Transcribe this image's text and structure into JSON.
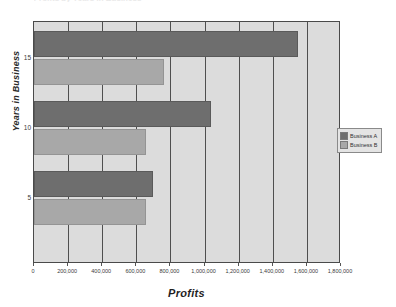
{
  "chart_data": {
    "type": "bar",
    "orientation": "horizontal",
    "title": "",
    "xlabel": "Profits",
    "ylabel": "Years in Business",
    "xlim": [
      0,
      1800000
    ],
    "x_tick_labels": [
      "0",
      "200,000",
      "400,000",
      "600,000",
      "800,000",
      "1,000,000",
      "1,200,000",
      "1,400,000",
      "1,600,000",
      "1,800,000"
    ],
    "x_tick_values": [
      0,
      200000,
      400000,
      600000,
      800000,
      1000000,
      1200000,
      1400000,
      1600000,
      1800000
    ],
    "categories": [
      "15",
      "10",
      "5"
    ],
    "y_tick_labels": [
      "15",
      "10",
      "5"
    ],
    "grid": "vertical",
    "legend_position": "right",
    "series": [
      {
        "name": "Business A",
        "color": "#6e6e6e",
        "values": [
          1550000,
          1035000,
          700000
        ]
      },
      {
        "name": "Business B",
        "color": "#a8a8a8",
        "values": [
          760000,
          655000,
          655000
        ]
      }
    ],
    "plot_background": "#dcdcdc",
    "gridline_color": "#4f4f4f",
    "title_remnant": "Profits by Years in Business"
  }
}
